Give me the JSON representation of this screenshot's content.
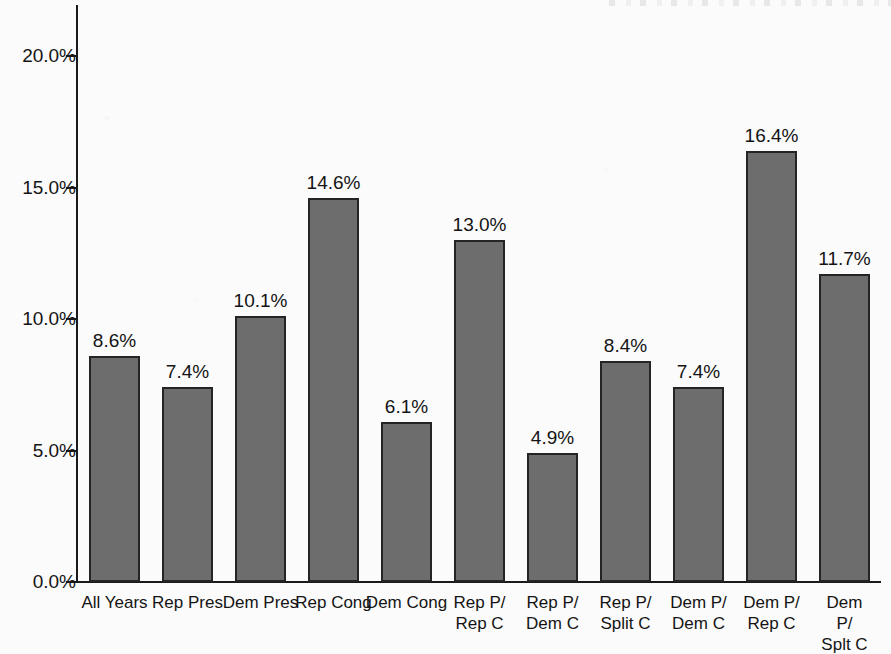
{
  "chart_data": {
    "type": "bar",
    "title": "",
    "xlabel": "",
    "ylabel": "",
    "ylim": [
      0,
      21.5
    ],
    "grid": false,
    "legend": "none",
    "y_ticks": [
      "0.0%",
      "5.0%",
      "10.0%",
      "15.0%",
      "20.0%"
    ],
    "y_tick_values": [
      0,
      5,
      10,
      15,
      20
    ],
    "categories": [
      "All Years",
      "Rep Pres",
      "Dem Pres",
      "Rep Cong",
      "Dem Cong",
      "Rep P/\nRep C",
      "Rep P/\nDem C",
      "Rep P/\nSplit C",
      "Dem P/\nDem C",
      "Dem P/\nRep C",
      "Dem P/\nSplt C"
    ],
    "values": [
      8.6,
      7.4,
      10.1,
      14.6,
      6.1,
      13.0,
      4.9,
      8.4,
      7.4,
      16.4,
      11.7
    ],
    "value_labels": [
      "8.6%",
      "7.4%",
      "10.1%",
      "14.6%",
      "6.1%",
      "13.0%",
      "4.9%",
      "8.4%",
      "7.4%",
      "16.4%",
      "11.7%"
    ],
    "bar_fill_color": "#6d6d6d",
    "bar_edge_color": "#242424",
    "axis_color": "#1a1a1a",
    "background_color": "#fbfbfb"
  }
}
